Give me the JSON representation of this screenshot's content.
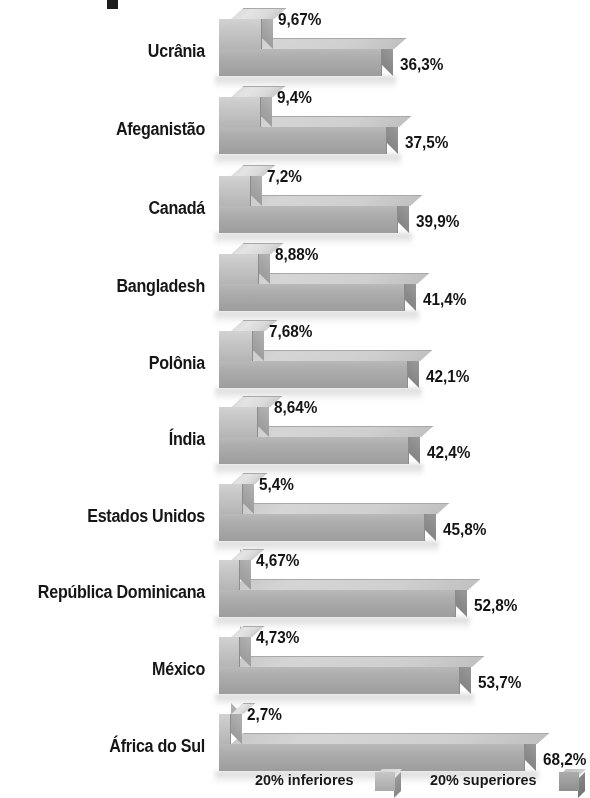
{
  "chart_data": {
    "type": "bar",
    "title": "",
    "xlabel": "",
    "ylabel": "",
    "orientation": "horizontal",
    "grid": false,
    "legend_position": "bottom",
    "xlim": [
      0,
      68.2
    ],
    "categories": [
      "Ucrânia",
      "Afeganistão",
      "Canadá",
      "Bangladesh",
      "Polônia",
      "Índia",
      "Estados Unidos",
      "República Dominicana",
      "México",
      "África do Sul"
    ],
    "series": [
      {
        "name": "20% inferiores",
        "values": [
          9.67,
          9.4,
          7.2,
          8.88,
          7.68,
          8.64,
          5.4,
          4.67,
          4.73,
          2.7
        ],
        "labels": [
          "9,67%",
          "9,4%",
          "7,2%",
          "8,88%",
          "7,68%",
          "8,64%",
          "5,4%",
          "4,67%",
          "4,73%",
          "2,7%"
        ],
        "color": "#c8c8c8"
      },
      {
        "name": "20% superiores",
        "values": [
          36.3,
          37.5,
          39.9,
          41.4,
          42.1,
          42.4,
          45.8,
          52.8,
          53.7,
          68.2
        ],
        "labels": [
          "36,3%",
          "37,5%",
          "39,9%",
          "41,4%",
          "42,1%",
          "42,4%",
          "45,8%",
          "52,8%",
          "53,7%",
          "68,2%"
        ],
        "color": "#a6a6a6"
      }
    ]
  },
  "legend": {
    "items": [
      {
        "label": "20% inferiores",
        "swatch": "light-cube-icon"
      },
      {
        "label": "20% superiores",
        "swatch": "dark-cube-icon"
      }
    ]
  }
}
